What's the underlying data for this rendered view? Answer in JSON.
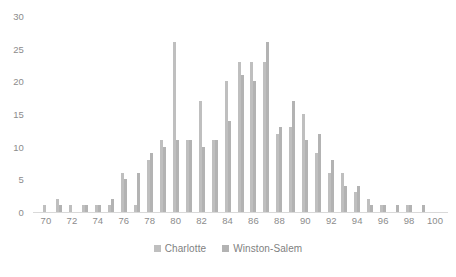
{
  "chart_data": {
    "type": "bar",
    "title": "",
    "subtitle": "",
    "xlabel": "",
    "ylabel": "",
    "grid": false,
    "legend_position": "bottom",
    "xlim": [
      69,
      101
    ],
    "ylim": [
      0,
      30
    ],
    "y_ticks": [
      30,
      25,
      20,
      15,
      10,
      5,
      0
    ],
    "x_ticks": [
      70,
      72,
      74,
      76,
      78,
      80,
      82,
      84,
      86,
      88,
      90,
      92,
      94,
      96,
      98,
      100
    ],
    "categories": [
      70,
      71,
      72,
      73,
      74,
      75,
      76,
      77,
      78,
      79,
      80,
      81,
      82,
      83,
      84,
      85,
      86,
      87,
      88,
      89,
      90,
      91,
      92,
      93,
      94,
      95,
      96,
      97,
      98,
      99,
      100
    ],
    "series": [
      {
        "name": "Charlotte",
        "color": "#bfbfbf",
        "values": [
          1,
          2,
          1,
          1,
          1,
          1,
          6,
          1,
          8,
          11,
          26,
          11,
          17,
          11,
          20,
          23,
          23,
          23,
          12,
          13,
          15,
          9,
          6,
          6,
          3,
          2,
          1,
          0,
          1,
          0,
          0
        ]
      },
      {
        "name": "Winston-Salem",
        "color": "#b3b3b3",
        "values": [
          0,
          1,
          0,
          1,
          1,
          2,
          5,
          6,
          9,
          10,
          11,
          11,
          10,
          11,
          14,
          21,
          20,
          26,
          13,
          17,
          11,
          12,
          8,
          4,
          4,
          1,
          1,
          1,
          1,
          1,
          0
        ]
      }
    ]
  },
  "legend": {
    "items": [
      {
        "label": "Charlotte"
      },
      {
        "label": "Winston-Salem"
      }
    ]
  }
}
